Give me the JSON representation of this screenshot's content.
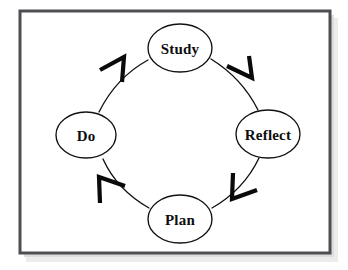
{
  "diagram": {
    "type": "cycle",
    "direction": "clockwise",
    "title": "",
    "frame": {
      "name": "diagram-frame",
      "border_color": "#4e4e52",
      "background_color": "#ffffff",
      "shadow_color": "#d9d9d9",
      "x": 20,
      "y": 11,
      "width": 310,
      "height": 242
    },
    "canvas": {
      "background_color": "#ffffff",
      "width": 348,
      "height": 270
    },
    "style": {
      "node_fill": "#ffffff",
      "node_stroke": "#111111",
      "label_color": "#0d0d0d",
      "arrow_color": "#0a0a0a",
      "arc_color": "#111111"
    },
    "center": {
      "x": 175,
      "y": 134
    },
    "nodes": [
      {
        "id": "study",
        "label": "Study",
        "position": "top",
        "cx": 180,
        "cy": 48,
        "rx": 32,
        "ry": 24
      },
      {
        "id": "reflect",
        "label": "Reflect",
        "position": "right",
        "cx": 268,
        "cy": 134,
        "rx": 32,
        "ry": 24
      },
      {
        "id": "plan",
        "label": "Plan",
        "position": "bottom",
        "cx": 180,
        "cy": 219,
        "rx": 32,
        "ry": 24
      },
      {
        "id": "do",
        "label": "Do",
        "position": "left",
        "cx": 86,
        "cy": 135,
        "rx": 30,
        "ry": 23
      }
    ],
    "edges": [
      {
        "id": "study-to-reflect",
        "from": "study",
        "to": "reflect",
        "label": "",
        "arrow_direction": "down-right",
        "path": "M 211 59 C 232 72 248 90 258 110",
        "arrow": {
          "tip_x": 252,
          "tip_y": 78,
          "a1_x": 227,
          "a1_y": 66,
          "a2_x": 249,
          "a2_y": 56
        }
      },
      {
        "id": "reflect-to-plan",
        "from": "reflect",
        "to": "plan",
        "label": "",
        "arrow_direction": "down-left",
        "path": "M 259 158 C 249 179 233 196 212 208",
        "arrow": {
          "tip_x": 232,
          "tip_y": 199,
          "a1_x": 233,
          "a1_y": 173,
          "a2_x": 257,
          "a2_y": 190
        }
      },
      {
        "id": "plan-to-do",
        "from": "plan",
        "to": "do",
        "label": "",
        "arrow_direction": "up-left",
        "path": "M 149 208 C 128 196 112 179 103 159",
        "arrow": {
          "tip_x": 99,
          "tip_y": 177,
          "a1_x": 100,
          "a1_y": 203,
          "a2_x": 125,
          "a2_y": 186
        }
      },
      {
        "id": "do-to-study",
        "from": "do",
        "to": "study",
        "label": "",
        "arrow_direction": "up-right",
        "path": "M 99 112 C 110 90 126 72 148 60",
        "arrow": {
          "tip_x": 124,
          "tip_y": 57,
          "a1_x": 100,
          "a1_y": 70,
          "a2_x": 122,
          "a2_y": 82
        }
      }
    ]
  }
}
